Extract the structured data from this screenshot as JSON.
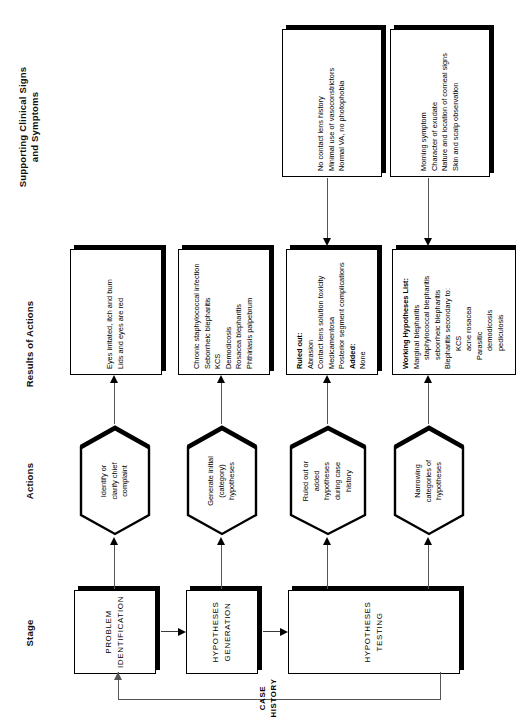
{
  "figure": {
    "orientation": "rotated-90-ccw",
    "columns": [
      {
        "id": "stage",
        "label": "Stage"
      },
      {
        "id": "actions",
        "label": "Actions"
      },
      {
        "id": "results",
        "label": "Results of Actions"
      },
      {
        "id": "clinical",
        "label": "Supporting Clinical Signs\nand Symptoms"
      }
    ],
    "column_labels": {
      "stage": "Stage",
      "actions": "Actions",
      "results": "Results of Actions",
      "clinical_line1": "Supporting Clinical Signs",
      "clinical_line2": "and Symptoms"
    },
    "stages": [
      {
        "id": "problem-identification",
        "line1": "PROBLEM",
        "line2": "IDENTIFICATION"
      },
      {
        "id": "hypotheses-generation",
        "line1": "HYPOTHESES",
        "line2": "GENERATION"
      },
      {
        "id": "hypotheses-testing",
        "line1": "HYPOTHESES",
        "line2": "TESTING"
      }
    ],
    "actions": [
      {
        "id": "identify-chief-complaint",
        "lines": [
          "Identify or",
          "clarify chief",
          "complaint"
        ]
      },
      {
        "id": "generate-initial-hypotheses",
        "lines": [
          "Generate initial",
          "(category)",
          "hypotheses"
        ]
      },
      {
        "id": "ruled-out-added-hypotheses",
        "lines": [
          "Ruled out or",
          "added",
          "hypotheses",
          "during case",
          "history"
        ]
      },
      {
        "id": "narrowing-categories",
        "lines": [
          "Narrowing",
          "categories of",
          "hypotheses"
        ]
      }
    ],
    "results": [
      {
        "id": "result-chief-complaint",
        "lines": [
          {
            "text": "Eyes irritated, itch and burn",
            "style": "plain"
          },
          {
            "text": "Lids and eyes are red",
            "style": "plain"
          }
        ]
      },
      {
        "id": "result-initial-hypotheses",
        "lines": [
          {
            "text": "Chronic staphylococcal infection",
            "style": "plain"
          },
          {
            "text": "Seborrheic blepharitis",
            "style": "plain"
          },
          {
            "text": "KCS",
            "style": "plain"
          },
          {
            "text": "Demodicosis",
            "style": "plain"
          },
          {
            "text": "Rosacea blepharitis",
            "style": "plain"
          },
          {
            "text": "Phthiriasis palpebrum",
            "style": "plain"
          }
        ]
      },
      {
        "id": "result-ruled-out",
        "lines": [
          {
            "text": "Ruled out:",
            "style": "bold"
          },
          {
            "text": "Abrasion",
            "style": "plain"
          },
          {
            "text": "Contact lens solution toxicity",
            "style": "plain"
          },
          {
            "text": "Medicamentosa",
            "style": "plain"
          },
          {
            "text": "Posterior segment complications",
            "style": "plain"
          },
          {
            "text": "Added:",
            "style": "bold"
          },
          {
            "text": "None",
            "style": "plain"
          }
        ]
      },
      {
        "id": "result-working-hypotheses",
        "lines": [
          {
            "text": "Working Hypotheses List:",
            "style": "bold"
          },
          {
            "text": "Marginal blepharitis",
            "style": "plain"
          },
          {
            "text": "staphylococcal blepharitis",
            "style": "indent1"
          },
          {
            "text": "seborrheic blepharitis",
            "style": "indent1"
          },
          {
            "text": "Blepharitis secondary to:",
            "style": "plain"
          },
          {
            "text": "KCS",
            "style": "indent2"
          },
          {
            "text": "acne rosacea",
            "style": "indent2"
          },
          {
            "text": "Parasitic",
            "style": "indent1"
          },
          {
            "text": "demodicosis",
            "style": "indent2"
          },
          {
            "text": "pediculosis",
            "style": "indent2"
          }
        ]
      }
    ],
    "clinical": [
      {
        "id": "clinical-case-history",
        "lines": [
          "No contact lens history",
          "Minimal use of vasoconstrictors",
          "Normal VA, no photophobia"
        ]
      },
      {
        "id": "clinical-narrowing",
        "lines": [
          "Morning symptom",
          "Character of exudate",
          "Nature and location of corneal signs",
          "Skin and scalp observation"
        ]
      }
    ],
    "feedback": {
      "id": "case-history-feedback",
      "line1": "CASE",
      "line2": "HISTORY"
    },
    "colors": {
      "ink": "#000000",
      "line": "#555555",
      "paper": "#ffffff"
    }
  }
}
